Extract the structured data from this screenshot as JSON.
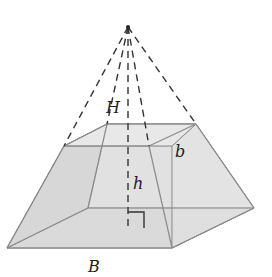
{
  "figure": {
    "labels": {
      "H": "H",
      "b": "b",
      "h": "h",
      "B": "B"
    },
    "colors": {
      "face_light": "#e8e8e8",
      "face_mid": "#dcdcdc",
      "face_dark": "#cfcfcf",
      "edge": "#8a8a8a",
      "dash": "#333333"
    }
  }
}
